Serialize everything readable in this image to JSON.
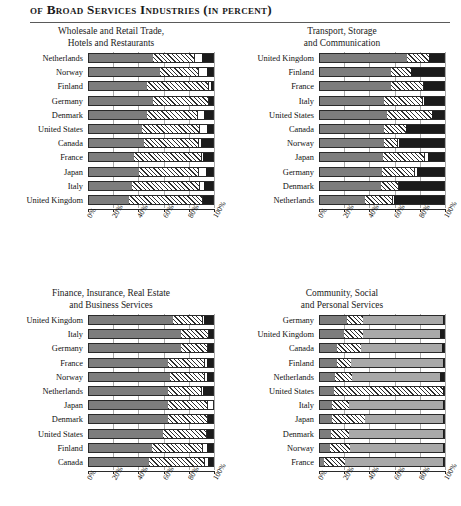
{
  "header": {
    "title": "of Broad Services Industries (in percent)"
  },
  "axis": {
    "ticks": [
      "0%",
      "20%",
      "40%",
      "60%",
      "80%",
      "100%"
    ],
    "min": 0,
    "max": 100
  },
  "chart_data": [
    {
      "id": "wholesale-retail",
      "type": "bar",
      "orientation": "horizontal",
      "stacked": true,
      "title": "Wholesale and Retail Trade,\nHotels and Restaurants",
      "title_line1": "Wholesale and Retail Trade,",
      "title_line2": "Hotels and Restaurants",
      "xlabel": "",
      "ylabel": "",
      "xlim": [
        0,
        100
      ],
      "grid": true,
      "legend": "none",
      "series": [
        {
          "name": "segment-1",
          "pattern": "solid-gray"
        },
        {
          "name": "segment-2",
          "pattern": "diagonal-hatch"
        },
        {
          "name": "segment-3",
          "pattern": "white"
        },
        {
          "name": "segment-4",
          "pattern": "solid-black"
        }
      ],
      "categories": [
        "Netherlands",
        "Norway",
        "Finland",
        "Germany",
        "Denmark",
        "United States",
        "Canada",
        "France",
        "Japan",
        "Italy",
        "United Kingdom"
      ],
      "values": [
        [
          52,
          33,
          6,
          9
        ],
        [
          57,
          31,
          7,
          5
        ],
        [
          47,
          49,
          2,
          2
        ],
        [
          52,
          44,
          1,
          3
        ],
        [
          47,
          40,
          6,
          7
        ],
        [
          43,
          46,
          6,
          5
        ],
        [
          44,
          44,
          2,
          10
        ],
        [
          36,
          54,
          2,
          8
        ],
        [
          40,
          48,
          6,
          6
        ],
        [
          35,
          54,
          4,
          7
        ],
        [
          32,
          59,
          1,
          8
        ]
      ]
    },
    {
      "id": "transport-storage",
      "type": "bar",
      "orientation": "horizontal",
      "stacked": true,
      "title": "Transport, Storage\nand Communication",
      "title_line1": "Transport, Storage",
      "title_line2": "and Communication",
      "xlabel": "",
      "ylabel": "",
      "xlim": [
        0,
        100
      ],
      "grid": true,
      "legend": "none",
      "series": [
        {
          "name": "segment-1",
          "pattern": "solid-gray"
        },
        {
          "name": "segment-2",
          "pattern": "diagonal-hatch"
        },
        {
          "name": "segment-3",
          "pattern": "white"
        },
        {
          "name": "segment-4",
          "pattern": "solid-black"
        }
      ],
      "categories": [
        "United Kingdom",
        "Finland",
        "France",
        "Italy",
        "United States",
        "Canada",
        "Norway",
        "Japan",
        "Germany",
        "Denmark",
        "Netherlands"
      ],
      "values": [
        [
          70,
          18,
          0,
          12
        ],
        [
          57,
          16,
          0,
          27
        ],
        [
          57,
          26,
          1,
          16
        ],
        [
          52,
          30,
          2,
          16
        ],
        [
          54,
          36,
          0,
          10
        ],
        [
          52,
          17,
          0,
          31
        ],
        [
          52,
          10,
          2,
          36
        ],
        [
          51,
          33,
          3,
          13
        ],
        [
          50,
          26,
          2,
          22
        ],
        [
          49,
          14,
          1,
          36
        ],
        [
          36,
          22,
          2,
          40
        ]
      ]
    },
    {
      "id": "finance-insurance",
      "type": "bar",
      "orientation": "horizontal",
      "stacked": true,
      "title": "Finance, Insurance, Real Estate\nand Business Services",
      "title_line1": "Finance, Insurance, Real Estate",
      "title_line2": "and Business Services",
      "xlabel": "",
      "ylabel": "",
      "xlim": [
        0,
        100
      ],
      "grid": true,
      "legend": "none",
      "series": [
        {
          "name": "segment-1",
          "pattern": "solid-gray"
        },
        {
          "name": "segment-2",
          "pattern": "diagonal-hatch"
        },
        {
          "name": "segment-3",
          "pattern": "white"
        },
        {
          "name": "segment-4",
          "pattern": "solid-black"
        }
      ],
      "categories": [
        "United Kingdom",
        "Italy",
        "Germany",
        "France",
        "Norway",
        "Netherlands",
        "Japan",
        "Denmark",
        "United States",
        "Finland",
        "Canada"
      ],
      "values": [
        [
          68,
          23,
          2,
          7
        ],
        [
          74,
          22,
          1,
          3
        ],
        [
          74,
          21,
          1,
          4
        ],
        [
          64,
          29,
          2,
          5
        ],
        [
          65,
          28,
          2,
          5
        ],
        [
          64,
          26,
          2,
          8
        ],
        [
          64,
          31,
          5,
          0
        ],
        [
          64,
          31,
          1,
          4
        ],
        [
          60,
          34,
          1,
          5
        ],
        [
          51,
          40,
          4,
          5
        ],
        [
          48,
          45,
          3,
          4
        ]
      ]
    },
    {
      "id": "community-social",
      "type": "bar",
      "orientation": "horizontal",
      "stacked": true,
      "title": "Community, Social\nand Personal Services",
      "title_line1": "Community, Social",
      "title_line2": "and Personal Services",
      "xlabel": "",
      "ylabel": "",
      "xlim": [
        0,
        100
      ],
      "grid": true,
      "legend": "none",
      "series": [
        {
          "name": "segment-1",
          "pattern": "solid-gray"
        },
        {
          "name": "segment-2",
          "pattern": "diagonal-hatch"
        },
        {
          "name": "segment-3",
          "pattern": "light-gray"
        },
        {
          "name": "segment-4",
          "pattern": "solid-black"
        }
      ],
      "categories": [
        "Germany",
        "United Kingdom",
        "Canada",
        "Finland",
        "Netherlands",
        "United States",
        "Italy",
        "Japan",
        "Denmark",
        "Norway",
        "France"
      ],
      "values": [
        [
          22,
          13,
          64,
          1
        ],
        [
          19,
          16,
          62,
          3
        ],
        [
          14,
          19,
          65,
          2
        ],
        [
          14,
          11,
          74,
          1
        ],
        [
          12,
          14,
          71,
          3
        ],
        [
          11,
          88,
          0,
          1
        ],
        [
          10,
          13,
          76,
          1
        ],
        [
          10,
          26,
          63,
          1
        ],
        [
          9,
          14,
          76,
          1
        ],
        [
          8,
          16,
          75,
          1
        ],
        [
          3,
          17,
          79,
          1
        ]
      ]
    }
  ]
}
